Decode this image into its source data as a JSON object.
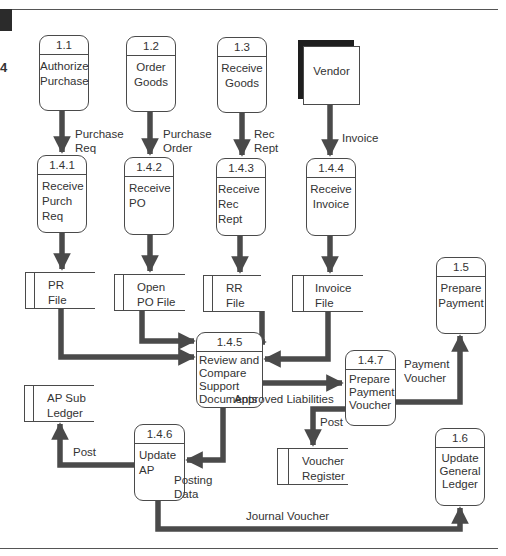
{
  "page": {
    "corner_marker": "4"
  },
  "colors": {
    "arrow": "#4a4a4a",
    "line": "#4a4a4a",
    "entity_shadow": "#1e1e1e",
    "background": "#ffffff"
  },
  "external_entities": [
    {
      "id": "vendor",
      "label": "Vendor"
    }
  ],
  "processes": {
    "p1_1": {
      "id": "1.1",
      "label": "Authorize\nPurchase"
    },
    "p1_2": {
      "id": "1.2",
      "label": "Order\nGoods"
    },
    "p1_3": {
      "id": "1.3",
      "label": "Receive\nGoods"
    },
    "p1_4_1": {
      "id": "1.4.1",
      "label": "Receive\nPurch\nReq"
    },
    "p1_4_2": {
      "id": "1.4.2",
      "label": "Receive\nPO"
    },
    "p1_4_3": {
      "id": "1.4.3",
      "label": "Receive\nRec Rept"
    },
    "p1_4_4": {
      "id": "1.4.4",
      "label": "Receive\nInvoice"
    },
    "p1_4_5": {
      "id": "1.4.5",
      "label": "Review and\nCompare\nSupport\nDocuments"
    },
    "p1_4_6": {
      "id": "1.4.6",
      "label": "Update\nAP"
    },
    "p1_4_7": {
      "id": "1.4.7",
      "label": "Prepare\nPayment\nVoucher"
    },
    "p1_5": {
      "id": "1.5",
      "label": "Prepare\nPayment"
    },
    "p1_6": {
      "id": "1.6",
      "label": "Update\nGeneral\nLedger"
    }
  },
  "data_stores": {
    "pr_file": {
      "label": "PR\nFile"
    },
    "open_po_file": {
      "label": "Open\nPO File"
    },
    "rr_file": {
      "label": "RR\nFile"
    },
    "invoice_file": {
      "label": "Invoice\nFile"
    },
    "ap_sub_ledger": {
      "label": "AP Sub\nLedger"
    },
    "voucher_register": {
      "label": "Voucher\nRegister"
    }
  },
  "flows": {
    "purchase_req": "Purchase\nReq",
    "purchase_order": "Purchase\nOrder",
    "rec_rept": "Rec\nRept",
    "invoice": "Invoice",
    "approved_liabilities": "Approved Liabilities",
    "payment_voucher": "Payment\nVoucher",
    "post_voucher": "Post",
    "post_ap": "Post",
    "posting_data": "Posting\nData",
    "journal_voucher": "Journal Voucher"
  }
}
